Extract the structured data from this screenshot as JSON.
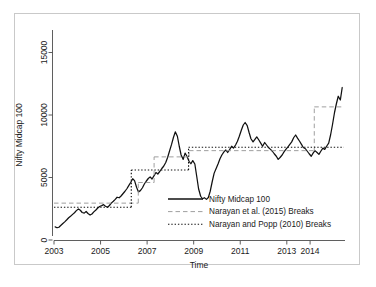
{
  "chart_data": {
    "type": "line",
    "title": "",
    "xlabel": "Time",
    "ylabel": "Nifty Midcap 100",
    "xlim": [
      2003.0,
      2015.5
    ],
    "ylim": [
      0,
      16800
    ],
    "grid": false,
    "legend_position": "bottom-center-right",
    "x_tick_labels": [
      "2003",
      "2005",
      "2007",
      "2009",
      "2011",
      "2013",
      "2014"
    ],
    "x_tick_values": [
      2003,
      2005,
      2007,
      2009,
      2011,
      2013,
      2014
    ],
    "y_tick_labels": [
      "0",
      "5000",
      "10000",
      "15000"
    ],
    "y_tick_values": [
      0,
      5000,
      10000,
      15000
    ],
    "series": [
      {
        "name": "Nifty Midcap 100",
        "style": "solid",
        "color": "#111111",
        "x": [
          2003.05,
          2003.13,
          2003.21,
          2003.3,
          2003.38,
          2003.46,
          2003.55,
          2003.63,
          2003.71,
          2003.8,
          2003.88,
          2003.96,
          2004.05,
          2004.13,
          2004.21,
          2004.3,
          2004.38,
          2004.46,
          2004.55,
          2004.63,
          2004.71,
          2004.8,
          2004.88,
          2004.96,
          2005.05,
          2005.13,
          2005.21,
          2005.3,
          2005.38,
          2005.46,
          2005.55,
          2005.63,
          2005.71,
          2005.8,
          2005.88,
          2005.96,
          2006.05,
          2006.13,
          2006.21,
          2006.3,
          2006.38,
          2006.46,
          2006.55,
          2006.63,
          2006.71,
          2006.8,
          2006.88,
          2006.96,
          2007.05,
          2007.13,
          2007.21,
          2007.3,
          2007.38,
          2007.46,
          2007.55,
          2007.63,
          2007.71,
          2007.8,
          2007.88,
          2007.96,
          2008.05,
          2008.13,
          2008.21,
          2008.3,
          2008.38,
          2008.46,
          2008.55,
          2008.63,
          2008.71,
          2008.8,
          2008.88,
          2008.96,
          2009.05,
          2009.13,
          2009.21,
          2009.3,
          2009.38,
          2009.46,
          2009.55,
          2009.63,
          2009.71,
          2009.8,
          2009.88,
          2009.96,
          2010.05,
          2010.13,
          2010.21,
          2010.3,
          2010.38,
          2010.46,
          2010.55,
          2010.63,
          2010.71,
          2010.8,
          2010.88,
          2010.96,
          2011.05,
          2011.13,
          2011.21,
          2011.3,
          2011.38,
          2011.46,
          2011.55,
          2011.63,
          2011.71,
          2011.8,
          2011.88,
          2011.96,
          2012.05,
          2012.13,
          2012.21,
          2012.3,
          2012.38,
          2012.46,
          2012.55,
          2012.63,
          2012.71,
          2012.8,
          2012.88,
          2012.96,
          2013.05,
          2013.13,
          2013.21,
          2013.3,
          2013.38,
          2013.46,
          2013.55,
          2013.63,
          2013.71,
          2013.8,
          2013.88,
          2013.96,
          2014.05,
          2014.13,
          2014.21,
          2014.3,
          2014.38,
          2014.46,
          2014.55,
          2014.63,
          2014.71,
          2014.8,
          2014.88,
          2014.96,
          2015.05,
          2015.13,
          2015.21,
          2015.3,
          2015.38
        ],
        "y": [
          1050,
          980,
          1020,
          1180,
          1320,
          1450,
          1620,
          1780,
          1900,
          2050,
          2180,
          2350,
          2480,
          2380,
          2200,
          2150,
          2280,
          2120,
          2000,
          2080,
          2250,
          2400,
          2560,
          2680,
          2750,
          2830,
          2700,
          2620,
          2760,
          2950,
          3100,
          3250,
          3420,
          3380,
          3520,
          3700,
          3900,
          4100,
          4350,
          4620,
          4900,
          4750,
          4200,
          3850,
          3950,
          4180,
          4480,
          4700,
          4920,
          5050,
          4880,
          5150,
          5400,
          5280,
          5500,
          5720,
          5900,
          6200,
          6600,
          7100,
          7650,
          8200,
          8650,
          8300,
          7500,
          6800,
          6450,
          6950,
          6700,
          6300,
          6100,
          6350,
          6080,
          5100,
          4100,
          3500,
          3300,
          3380,
          3250,
          3400,
          3900,
          4700,
          5350,
          5700,
          6100,
          6500,
          6800,
          7050,
          7200,
          7000,
          7250,
          7500,
          7350,
          7600,
          7900,
          8300,
          8800,
          9200,
          9400,
          9150,
          8600,
          8100,
          7850,
          8050,
          8250,
          8000,
          7750,
          7500,
          7800,
          7600,
          7400,
          7250,
          7100,
          6900,
          6700,
          6450,
          6600,
          6800,
          7050,
          7250,
          7450,
          7650,
          7850,
          8200,
          8400,
          8150,
          7900,
          7650,
          7400,
          7300,
          7100,
          6900,
          6700,
          6950,
          7150,
          7000,
          6850,
          7100,
          7350,
          7250,
          7500,
          7750,
          8400,
          9200,
          10200,
          10900,
          11500,
          11200,
          12200
        ]
      },
      {
        "name": "Narayan et al. (2015) Breaks",
        "style": "dashed",
        "color": "#9a9a9a",
        "segments": [
          {
            "x_start": 2003.0,
            "x_end": 2006.62,
            "level": 2950
          },
          {
            "x_start": 2006.62,
            "x_end": 2007.3,
            "level": 4600
          },
          {
            "x_start": 2007.3,
            "x_end": 2008.8,
            "level": 6650
          },
          {
            "x_start": 2008.8,
            "x_end": 2014.18,
            "level": 7150
          },
          {
            "x_start": 2014.18,
            "x_end": 2015.45,
            "level": 10650
          }
        ]
      },
      {
        "name": "Narayan and Popp (2010) Breaks",
        "style": "dotted",
        "color": "#111111",
        "segments": [
          {
            "x_start": 2003.0,
            "x_end": 2006.32,
            "level": 2620
          },
          {
            "x_start": 2006.32,
            "x_end": 2008.78,
            "level": 5600
          },
          {
            "x_start": 2008.78,
            "x_end": 2015.45,
            "level": 7420
          }
        ]
      }
    ]
  },
  "axes": {
    "x_title": "Time",
    "y_title": "Nifty Midcap 100"
  },
  "legend": {
    "items": [
      {
        "label": "Nifty Midcap 100",
        "style": "solid",
        "color": "#111111"
      },
      {
        "label": "Narayan et al. (2015) Breaks",
        "style": "dashed",
        "color": "#9a9a9a"
      },
      {
        "label": "Narayan and Popp (2010) Breaks",
        "style": "dotted",
        "color": "#111111"
      }
    ]
  }
}
